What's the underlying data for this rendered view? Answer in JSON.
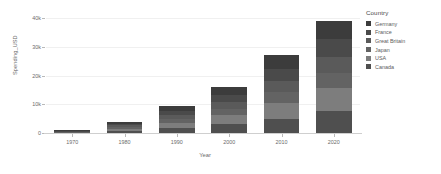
{
  "chart_data": {
    "type": "bar",
    "stacked": true,
    "title": "",
    "xlabel": "Year",
    "ylabel": "Spending_USD",
    "categories": [
      "1970",
      "1980",
      "1990",
      "2000",
      "2010",
      "2020"
    ],
    "ylim": [
      0,
      40000
    ],
    "y_ticks": [
      0,
      10000,
      20000,
      30000,
      40000
    ],
    "y_tick_labels": [
      "0",
      "10k",
      "20k",
      "30k",
      "40k"
    ],
    "grid": true,
    "legend_title": "Country",
    "legend_position": "right",
    "series": [
      {
        "name": "Germany",
        "color": "#3c3c3c",
        "values": [
          200,
          700,
          1700,
          2700,
          4600,
          6400
        ]
      },
      {
        "name": "France",
        "color": "#4a4a4a",
        "values": [
          180,
          650,
          1500,
          2500,
          4300,
          6000
        ]
      },
      {
        "name": "Great Britain",
        "color": "#5a5a5a",
        "values": [
          150,
          600,
          1400,
          2300,
          3900,
          5600
        ]
      },
      {
        "name": "Japan",
        "color": "#636363",
        "values": [
          140,
          550,
          1300,
          2200,
          3700,
          5300
        ]
      },
      {
        "name": "USA",
        "color": "#7d7d7d",
        "values": [
          180,
          700,
          1900,
          3300,
          5500,
          7900
        ]
      },
      {
        "name": "Canada",
        "color": "#4f4f4f",
        "values": [
          150,
          800,
          1700,
          3000,
          5000,
          7800
        ]
      }
    ],
    "bar_totals": [
      1000,
      4000,
      9500,
      16000,
      27000,
      39000
    ],
    "colors": {
      "gridline": "#f0f0f0",
      "axis_line": "#cfcfcf",
      "tick_mark": "#b9b9b9",
      "axis_text": "#6b6b6b",
      "legend_text": "#5c5c5c",
      "legend_title_text": "#4a4a4a",
      "background": "#ffffff"
    }
  }
}
